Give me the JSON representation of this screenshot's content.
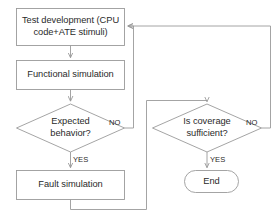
{
  "diagram": {
    "type": "flowchart",
    "background_color": "#ffffff",
    "stroke_color": "#808080",
    "text_color": "#2a2a2a",
    "nodes": [
      {
        "id": "test-development",
        "shape": "process",
        "label": "Test development (CPU\ncode+ATE stimuli)"
      },
      {
        "id": "functional-simulation",
        "shape": "process",
        "label": "Functional simulation"
      },
      {
        "id": "expected-behavior",
        "shape": "decision",
        "label": "Expected\nbehavior?"
      },
      {
        "id": "fault-simulation",
        "shape": "process",
        "label": "Fault simulation"
      },
      {
        "id": "coverage-sufficient",
        "shape": "decision",
        "label": "Is coverage\nsufficient?"
      },
      {
        "id": "end",
        "shape": "terminator",
        "label": "End"
      }
    ],
    "edge_labels": {
      "expected_behavior_no": "NO",
      "expected_behavior_yes": "YES",
      "coverage_no": "NO",
      "coverage_yes": "YES"
    }
  }
}
